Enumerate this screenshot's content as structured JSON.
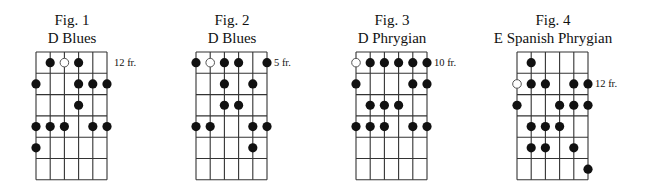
{
  "grid": {
    "strings": 6,
    "frets": 6,
    "string_spacing": 14.2,
    "fret_spacing": 21.3,
    "line_color": "#333333",
    "dot_color": "#111111",
    "open_dot_fill": "#ffffff"
  },
  "figures": [
    {
      "number_label": "Fig. 1",
      "scale_name": "D Blues",
      "fret_label": "12 fr.",
      "fret_label_row": 1,
      "grid_left": 36,
      "center_x": 72,
      "dots": [
        {
          "row": 1,
          "string": 2,
          "type": "filled"
        },
        {
          "row": 1,
          "string": 3,
          "type": "open"
        },
        {
          "row": 1,
          "string": 4,
          "type": "filled"
        },
        {
          "row": 2,
          "string": 1,
          "type": "filled"
        },
        {
          "row": 2,
          "string": 4,
          "type": "filled"
        },
        {
          "row": 2,
          "string": 5,
          "type": "filled"
        },
        {
          "row": 2,
          "string": 6,
          "type": "filled"
        },
        {
          "row": 3,
          "string": 4,
          "type": "filled"
        },
        {
          "row": 4,
          "string": 1,
          "type": "filled"
        },
        {
          "row": 4,
          "string": 2,
          "type": "filled"
        },
        {
          "row": 4,
          "string": 3,
          "type": "filled"
        },
        {
          "row": 4,
          "string": 5,
          "type": "filled"
        },
        {
          "row": 4,
          "string": 6,
          "type": "filled"
        },
        {
          "row": 5,
          "string": 1,
          "type": "filled"
        }
      ]
    },
    {
      "number_label": "Fig. 2",
      "scale_name": "D Blues",
      "fret_label": "5 fr.",
      "fret_label_row": 1,
      "grid_left": 196,
      "center_x": 232,
      "dots": [
        {
          "row": 1,
          "string": 1,
          "type": "filled"
        },
        {
          "row": 1,
          "string": 2,
          "type": "open"
        },
        {
          "row": 1,
          "string": 3,
          "type": "filled"
        },
        {
          "row": 1,
          "string": 4,
          "type": "filled"
        },
        {
          "row": 1,
          "string": 6,
          "type": "filled"
        },
        {
          "row": 2,
          "string": 3,
          "type": "filled"
        },
        {
          "row": 2,
          "string": 5,
          "type": "filled"
        },
        {
          "row": 3,
          "string": 3,
          "type": "filled"
        },
        {
          "row": 3,
          "string": 4,
          "type": "filled"
        },
        {
          "row": 4,
          "string": 1,
          "type": "filled"
        },
        {
          "row": 4,
          "string": 2,
          "type": "filled"
        },
        {
          "row": 4,
          "string": 5,
          "type": "filled"
        },
        {
          "row": 4,
          "string": 6,
          "type": "filled"
        },
        {
          "row": 5,
          "string": 5,
          "type": "filled"
        }
      ]
    },
    {
      "number_label": "Fig. 3",
      "scale_name": "D Phrygian",
      "fret_label": "10 fr.",
      "fret_label_row": 1,
      "grid_left": 356,
      "center_x": 392,
      "dots": [
        {
          "row": 1,
          "string": 1,
          "type": "open"
        },
        {
          "row": 1,
          "string": 2,
          "type": "filled"
        },
        {
          "row": 1,
          "string": 3,
          "type": "filled"
        },
        {
          "row": 1,
          "string": 4,
          "type": "filled"
        },
        {
          "row": 1,
          "string": 5,
          "type": "filled"
        },
        {
          "row": 1,
          "string": 6,
          "type": "filled"
        },
        {
          "row": 2,
          "string": 1,
          "type": "filled"
        },
        {
          "row": 2,
          "string": 5,
          "type": "filled"
        },
        {
          "row": 2,
          "string": 6,
          "type": "filled"
        },
        {
          "row": 3,
          "string": 2,
          "type": "filled"
        },
        {
          "row": 3,
          "string": 3,
          "type": "filled"
        },
        {
          "row": 3,
          "string": 4,
          "type": "filled"
        },
        {
          "row": 4,
          "string": 1,
          "type": "filled"
        },
        {
          "row": 4,
          "string": 2,
          "type": "filled"
        },
        {
          "row": 4,
          "string": 3,
          "type": "filled"
        },
        {
          "row": 4,
          "string": 5,
          "type": "filled"
        },
        {
          "row": 4,
          "string": 6,
          "type": "filled"
        }
      ]
    },
    {
      "number_label": "Fig. 4",
      "scale_name": "E Spanish Phrygian",
      "fret_label": "12 fr.",
      "fret_label_row": 2,
      "grid_left": 517,
      "center_x": 553,
      "dots": [
        {
          "row": 1,
          "string": 2,
          "type": "filled"
        },
        {
          "row": 2,
          "string": 1,
          "type": "open"
        },
        {
          "row": 2,
          "string": 2,
          "type": "filled"
        },
        {
          "row": 2,
          "string": 3,
          "type": "filled"
        },
        {
          "row": 2,
          "string": 5,
          "type": "filled"
        },
        {
          "row": 2,
          "string": 6,
          "type": "filled"
        },
        {
          "row": 3,
          "string": 1,
          "type": "filled"
        },
        {
          "row": 3,
          "string": 4,
          "type": "filled"
        },
        {
          "row": 3,
          "string": 5,
          "type": "filled"
        },
        {
          "row": 3,
          "string": 6,
          "type": "filled"
        },
        {
          "row": 4,
          "string": 2,
          "type": "filled"
        },
        {
          "row": 4,
          "string": 3,
          "type": "filled"
        },
        {
          "row": 4,
          "string": 4,
          "type": "filled"
        },
        {
          "row": 5,
          "string": 2,
          "type": "filled"
        },
        {
          "row": 5,
          "string": 3,
          "type": "filled"
        },
        {
          "row": 5,
          "string": 5,
          "type": "filled"
        },
        {
          "row": 6,
          "string": 6,
          "type": "filled"
        }
      ]
    }
  ]
}
